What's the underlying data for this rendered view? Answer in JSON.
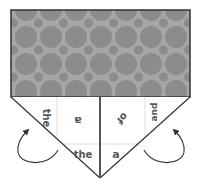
{
  "diagram": {
    "colors": {
      "pattern_bg": "#a6a6a6",
      "pattern_circle": "#8c8c8c",
      "outline": "#333333",
      "grid_line": "#dddddd",
      "text": "#555555",
      "arrow": "#333333",
      "paper": "#ffffff"
    },
    "words": [
      {
        "id": "left-outer",
        "text": "the",
        "rotation": 90
      },
      {
        "id": "left-inner",
        "text": "a",
        "rotation": 180
      },
      {
        "id": "left-bottom",
        "text": "the",
        "rotation": 0
      },
      {
        "id": "right-inner",
        "text": "of",
        "rotation": 135
      },
      {
        "id": "right-outer",
        "text": "and",
        "rotation": -90
      },
      {
        "id": "right-bottom",
        "text": "a",
        "rotation": 0
      }
    ],
    "arrows": [
      {
        "id": "left-fold-arrow",
        "direction": "counterclockwise-up"
      },
      {
        "id": "right-fold-arrow",
        "direction": "clockwise-up"
      }
    ]
  }
}
